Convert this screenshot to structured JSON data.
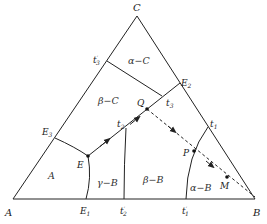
{
  "diagram": {
    "type": "ternary-phase-diagram",
    "vertices": {
      "A": "A",
      "B": "B",
      "C": "C"
    },
    "points": {
      "E": "E",
      "E1": "E",
      "E1_sub": "1",
      "E2": "E",
      "E2_sub": "2",
      "E3": "E",
      "E3_sub": "3",
      "t1": "t",
      "t1_sub": "1",
      "t2": "t",
      "t2_sub": "2",
      "t3": "t",
      "t3_sub": "3",
      "t1p": "t",
      "t1p_sub": "1",
      "t2p": "t",
      "t2p_sub": "2",
      "t3p": "t",
      "t3p_sub": "3",
      "prime": "′",
      "Q": "Q",
      "P": "P",
      "M": "M"
    },
    "regions": {
      "alpha_C": "α−C",
      "beta_C": "β−C",
      "A": "A",
      "gamma_B": "γ−B",
      "beta_B": "β−B",
      "alpha_B": "α−B"
    },
    "colors": {
      "line": "#222222",
      "background": "#ffffff"
    }
  }
}
